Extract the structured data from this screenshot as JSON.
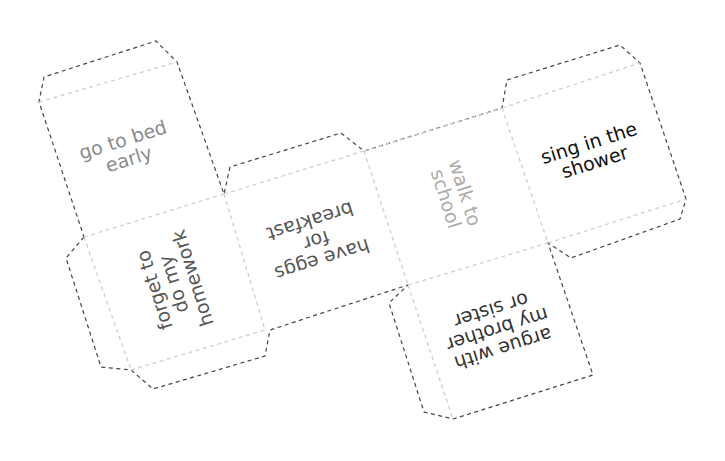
{
  "faces": [
    {
      "id": "top",
      "label": "go to bed\nearly",
      "color": "#8a8a8a",
      "rotation": -17.5,
      "center": [
        126,
        150
      ],
      "font_size": 19
    },
    {
      "id": "left",
      "label": "forget to\ndo my\nhomework",
      "color": "#555555",
      "rotation": -107.5,
      "center": [
        174,
        284
      ],
      "font_size": 19
    },
    {
      "id": "middle",
      "label": "have eggs\nfor\nbreakfast",
      "color": "#555555",
      "rotation": 162.5,
      "center": [
        316,
        240
      ],
      "font_size": 19
    },
    {
      "id": "right-middle",
      "label": "walk to\nschool",
      "color": "#aaaaaa",
      "rotation": 72.5,
      "center": [
        455,
        196
      ],
      "font_size": 19
    },
    {
      "id": "end",
      "label": "sing in the\nshower",
      "color": "#111111",
      "rotation": -17.5,
      "center": [
        592,
        153
      ],
      "font_size": 19
    },
    {
      "id": "bottom",
      "label": "argue with\nmy brother\nor sister",
      "color": "#333333",
      "rotation": 162.5,
      "center": [
        497,
        329
      ],
      "font_size": 19
    }
  ],
  "colors": {
    "cut_line": "#444444",
    "fold_line": "#cfcfcf",
    "background": "#ffffff"
  }
}
